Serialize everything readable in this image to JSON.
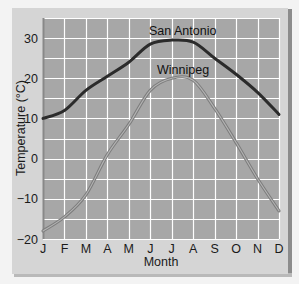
{
  "chart_data": {
    "type": "line",
    "title": "",
    "xlabel": "Month",
    "ylabel": "Temperature (°C)",
    "categories": [
      "J",
      "F",
      "M",
      "A",
      "M",
      "J",
      "J",
      "A",
      "S",
      "O",
      "N",
      "D"
    ],
    "ylim": [
      -20,
      35
    ],
    "yticks": [
      30,
      20,
      10,
      0,
      -10,
      -20
    ],
    "grid": true,
    "series": [
      {
        "name": "San Antonio",
        "color": "#2b2b2b",
        "values": [
          10,
          12,
          17,
          20.5,
          24,
          28.5,
          29.5,
          29,
          25,
          21,
          16.5,
          11
        ]
      },
      {
        "name": "Winnipeg",
        "color": "#8a8a8a",
        "values": [
          -18,
          -14.5,
          -9,
          1,
          8.5,
          17,
          20,
          19.5,
          12.5,
          4,
          -5,
          -13
        ]
      }
    ],
    "annotations": [
      {
        "text": "San Antonio",
        "near": "Jul"
      },
      {
        "text": "Winnipeg",
        "near": "Jul"
      }
    ]
  },
  "colors": {
    "page_background": "#f3f3f3",
    "panel_background": "#d5d5d5",
    "plot_background": "#a7a7a7",
    "gridline": "#ffffff"
  }
}
